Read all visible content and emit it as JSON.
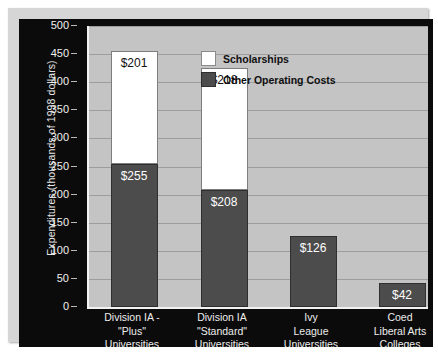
{
  "chart_data": {
    "type": "bar",
    "subtype": "stacked-bar",
    "title": "",
    "xlabel": "",
    "ylabel": "Expenditures (thousands of 1998 dollars)",
    "ylim": [
      0,
      500
    ],
    "ytick_values": [
      0,
      50,
      100,
      150,
      200,
      250,
      300,
      350,
      400,
      450,
      500
    ],
    "ytick_labels": [
      "0",
      "50",
      "100",
      "150",
      "200",
      "250",
      "300",
      "350",
      "400",
      "450",
      "500"
    ],
    "grid": true,
    "legend_position": "upper-right-inside",
    "categories": [
      "Division IA - \"Plus\" Universities",
      "Division IA \"Standard\" Universities",
      "Ivy League Universities",
      "Coed Liberal Arts Colleges"
    ],
    "category_lines": [
      [
        "Division IA -",
        "\"Plus\"",
        "Universities"
      ],
      [
        "Division IA",
        "\"Standard\"",
        "Universities"
      ],
      [
        "Ivy",
        "League",
        "Universities"
      ],
      [
        "Coed",
        "Liberal Arts",
        "Colleges"
      ]
    ],
    "series": [
      {
        "name": "Scholarships",
        "color": "#ffffff",
        "values": [
          201,
          218,
          0,
          0
        ],
        "value_labels": [
          "$201",
          "$218",
          "",
          ""
        ]
      },
      {
        "name": "Other Operating Costs",
        "color": "#4c4c4c",
        "values": [
          255,
          208,
          126,
          42
        ],
        "value_labels": [
          "$255",
          "$208",
          "$126",
          "$42"
        ]
      }
    ],
    "totals": [
      456,
      426,
      126,
      42
    ]
  },
  "legend": {
    "items": [
      {
        "label": "Scholarships",
        "swatch": "#ffffff"
      },
      {
        "label": "Other Operating Costs",
        "swatch": "#4c4c4c"
      }
    ]
  },
  "axes": {
    "y_title": "Expenditures (thousands of 1998 dollars)",
    "y_ticks": [
      "500",
      "450",
      "400",
      "350",
      "300",
      "250",
      "200",
      "150",
      "100",
      "50",
      "0"
    ]
  },
  "colors": {
    "panel_background": "#0b0b0b",
    "plot_background": "#c4c4c4",
    "gridline": "#9d9d9d",
    "axis_text": "#ededed",
    "bar_dark": "#4c4c4c",
    "bar_light": "#ffffff",
    "frame": "#d6d6d6"
  }
}
